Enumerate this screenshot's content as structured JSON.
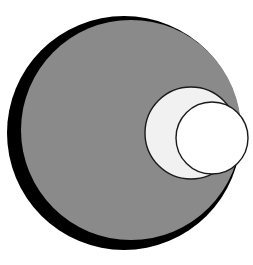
{
  "figure": {
    "name": "nested-tangent-circles",
    "background_color": "#ffffff",
    "canvas": {
      "width": 253,
      "height": 265
    },
    "circles": [
      {
        "id": "outer-black-circle",
        "label": "Outer circle",
        "cx": 124,
        "cy": 133,
        "r": 117,
        "fill": "#000000",
        "stroke": "#000000",
        "stroke_width": 0,
        "order": 1
      },
      {
        "id": "gray-circle",
        "label": "Gray circle",
        "cx": 131,
        "cy": 130,
        "r": 110,
        "fill": "#8a8a8a",
        "stroke": "#1a1a1a",
        "stroke_width": 0,
        "order": 2
      },
      {
        "id": "light-gray-circle",
        "label": "Light gray circle",
        "cx": 191,
        "cy": 133,
        "r": 46,
        "fill": "#f1f1f1",
        "stroke": "#1a1a1a",
        "stroke_width": 1.4,
        "order": 3
      },
      {
        "id": "white-circle",
        "label": "White circle",
        "cx": 212,
        "cy": 138,
        "r": 36,
        "fill": "#ffffff",
        "stroke": "#1a1a1a",
        "stroke_width": 1.4,
        "order": 4
      }
    ],
    "colors": {
      "black": "#000000",
      "gray": "#8a8a8a",
      "light_gray": "#f1f1f1",
      "white": "#ffffff",
      "outline": "#1a1a1a",
      "background": "#ffffff"
    }
  }
}
